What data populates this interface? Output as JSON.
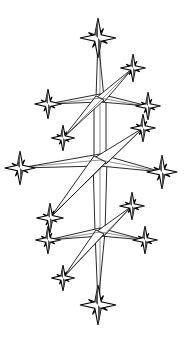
{
  "illustration": {
    "subject": "line-art crystalline star cluster",
    "colors": {
      "background": "#ffffff",
      "line": "#111111"
    },
    "hubs": [
      {
        "id": "upper",
        "x": 100,
        "y": 98
      },
      {
        "id": "middle",
        "x": 100,
        "y": 160
      },
      {
        "id": "lower",
        "x": 100,
        "y": 232
      }
    ],
    "stars": [
      {
        "x": 98,
        "y": 38,
        "r": 20
      },
      {
        "x": 133,
        "y": 68,
        "r": 14
      },
      {
        "x": 48,
        "y": 104,
        "r": 15
      },
      {
        "x": 148,
        "y": 106,
        "r": 14
      },
      {
        "x": 63,
        "y": 138,
        "r": 13
      },
      {
        "x": 143,
        "y": 128,
        "r": 14
      },
      {
        "x": 20,
        "y": 168,
        "r": 17
      },
      {
        "x": 162,
        "y": 172,
        "r": 17
      },
      {
        "x": 50,
        "y": 218,
        "r": 15
      },
      {
        "x": 132,
        "y": 206,
        "r": 14
      },
      {
        "x": 48,
        "y": 240,
        "r": 14
      },
      {
        "x": 145,
        "y": 240,
        "r": 14
      },
      {
        "x": 63,
        "y": 278,
        "r": 13
      },
      {
        "x": 98,
        "y": 305,
        "r": 20
      }
    ]
  }
}
